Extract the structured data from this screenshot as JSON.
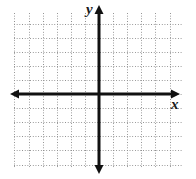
{
  "figure": {
    "kind": "blank-cartesian-coordinate-plane",
    "width": 196,
    "height": 179,
    "background_color": "#ffffff"
  },
  "grid": {
    "style": "dotted",
    "line_color": "#8f8f8f",
    "cell_size_px": 14.1,
    "left_px": 14,
    "top_px": 13,
    "width_px": 169,
    "height_px": 155,
    "vertical_line_count": 13,
    "horizontal_line_count": 12
  },
  "axes": {
    "color": "#111111",
    "stroke_width_px": 3,
    "origin": {
      "x_px": 99,
      "y_px": 94
    },
    "x_axis": {
      "label": "x",
      "label_style": "italic",
      "start_px": 10,
      "end_px": 180,
      "arrowheads": "both"
    },
    "y_axis": {
      "label": "y",
      "label_style": "italic",
      "start_px": 6,
      "end_px": 173,
      "arrowheads": "both"
    }
  },
  "chart_data": {
    "type": "scatter",
    "title": "",
    "xlabel": "x",
    "ylabel": "y",
    "x": [],
    "y": [],
    "series": [],
    "xlim": [
      -6,
      6
    ],
    "ylim": [
      -6,
      6
    ],
    "grid": true,
    "legend": "none",
    "tick_labels": {
      "x": [],
      "y": []
    },
    "annotations": []
  }
}
